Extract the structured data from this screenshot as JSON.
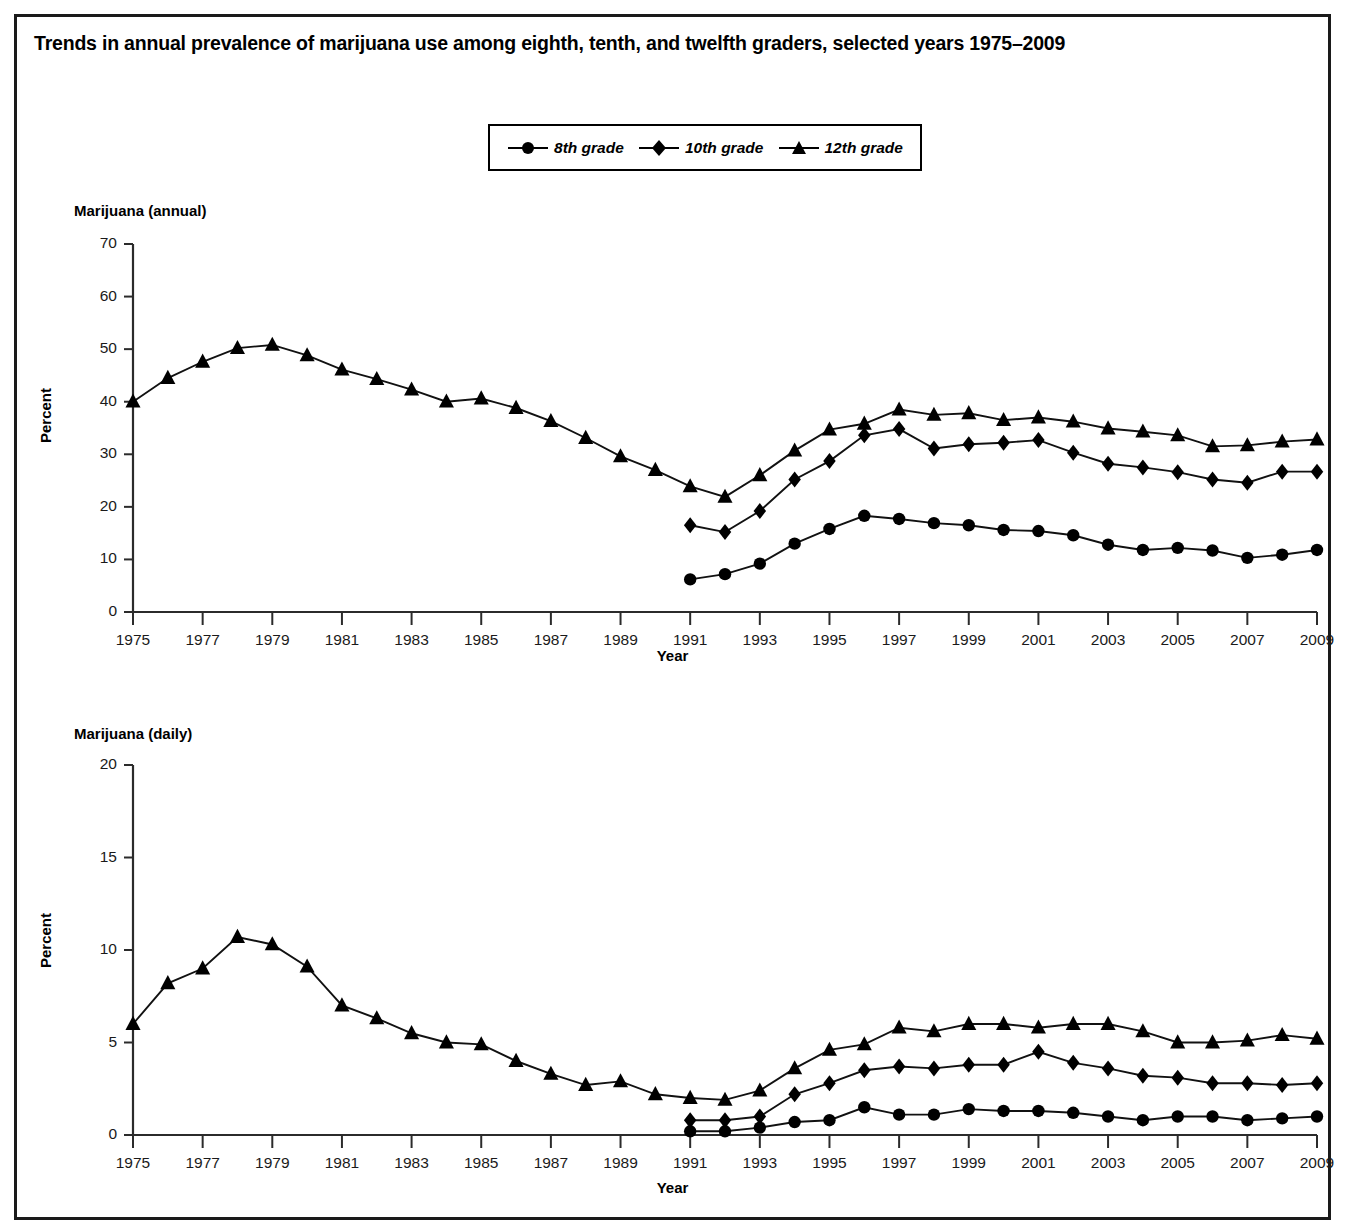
{
  "chart_title": "Trends in annual prevalence of marijuana use among eighth, tenth, and twelfth graders, selected years 1975–2009",
  "legend": {
    "entries": [
      {
        "label": "8th grade",
        "marker": "circle-marker-icon"
      },
      {
        "label": "10th grade",
        "marker": "diamond-marker-icon"
      },
      {
        "label": "12th grade",
        "marker": "triangle-marker-icon"
      }
    ]
  },
  "colors": {
    "ink": "#000000",
    "axis": "#2b2b2b",
    "frame": "#1a1a1a",
    "background": "#ffffff"
  },
  "chart_data": [
    {
      "type": "line",
      "id": "marijuana-annual",
      "title": "Marijuana (annual)",
      "xlabel": "Year",
      "ylabel": "Percent",
      "ylim": [
        0,
        70
      ],
      "yticks": [
        0,
        10,
        20,
        30,
        40,
        50,
        60,
        70
      ],
      "xlim": [
        1975,
        2009
      ],
      "xticks": [
        1975,
        1977,
        1979,
        1981,
        1983,
        1985,
        1987,
        1989,
        1991,
        1993,
        1995,
        1997,
        1999,
        2001,
        2003,
        2005,
        2007,
        2009
      ],
      "grid": false,
      "legend_position": "top-center",
      "x": [
        1975,
        1976,
        1977,
        1978,
        1979,
        1980,
        1981,
        1982,
        1983,
        1984,
        1985,
        1986,
        1987,
        1988,
        1989,
        1990,
        1991,
        1992,
        1993,
        1994,
        1995,
        1996,
        1997,
        1998,
        1999,
        2000,
        2001,
        2002,
        2003,
        2004,
        2005,
        2006,
        2007,
        2008,
        2009
      ],
      "series": [
        {
          "name": "8th grade",
          "marker": "circle",
          "x": [
            1991,
            1992,
            1993,
            1994,
            1995,
            1996,
            1997,
            1998,
            1999,
            2000,
            2001,
            2002,
            2003,
            2004,
            2005,
            2006,
            2007,
            2008,
            2009
          ],
          "values": [
            6.2,
            7.2,
            9.2,
            13.0,
            15.8,
            18.3,
            17.7,
            16.9,
            16.5,
            15.6,
            15.4,
            14.6,
            12.8,
            11.8,
            12.2,
            11.7,
            10.3,
            10.9,
            11.8
          ]
        },
        {
          "name": "10th grade",
          "marker": "diamond",
          "x": [
            1991,
            1992,
            1993,
            1994,
            1995,
            1996,
            1997,
            1998,
            1999,
            2000,
            2001,
            2002,
            2003,
            2004,
            2005,
            2006,
            2007,
            2008,
            2009
          ],
          "values": [
            16.5,
            15.2,
            19.2,
            25.2,
            28.7,
            33.6,
            34.8,
            31.1,
            31.9,
            32.2,
            32.7,
            30.3,
            28.2,
            27.5,
            26.6,
            25.2,
            24.6,
            26.7,
            26.7
          ]
        },
        {
          "name": "12th grade",
          "marker": "triangle",
          "x": [
            1975,
            1976,
            1977,
            1978,
            1979,
            1980,
            1981,
            1982,
            1983,
            1984,
            1985,
            1986,
            1987,
            1988,
            1989,
            1990,
            1991,
            1992,
            1993,
            1994,
            1995,
            1996,
            1997,
            1998,
            1999,
            2000,
            2001,
            2002,
            2003,
            2004,
            2005,
            2006,
            2007,
            2008,
            2009
          ],
          "values": [
            40.0,
            44.5,
            47.6,
            50.2,
            50.8,
            48.8,
            46.1,
            44.3,
            42.3,
            40.0,
            40.6,
            38.8,
            36.3,
            33.1,
            29.6,
            27.0,
            23.9,
            21.9,
            26.0,
            30.7,
            34.7,
            35.8,
            38.5,
            37.5,
            37.8,
            36.5,
            37.0,
            36.2,
            34.9,
            34.3,
            33.6,
            31.5,
            31.7,
            32.4,
            32.8
          ]
        }
      ]
    },
    {
      "type": "line",
      "id": "marijuana-daily",
      "title": "Marijuana (daily)",
      "xlabel": "Year",
      "ylabel": "Percent",
      "ylim": [
        0,
        20
      ],
      "yticks": [
        0,
        5,
        10,
        15,
        20
      ],
      "xlim": [
        1975,
        2009
      ],
      "xticks": [
        1975,
        1977,
        1979,
        1981,
        1983,
        1985,
        1987,
        1989,
        1991,
        1993,
        1995,
        1997,
        1999,
        2001,
        2003,
        2005,
        2007,
        2009
      ],
      "grid": false,
      "legend_position": "top-center",
      "x": [
        1975,
        1976,
        1977,
        1978,
        1979,
        1980,
        1981,
        1982,
        1983,
        1984,
        1985,
        1986,
        1987,
        1988,
        1989,
        1990,
        1991,
        1992,
        1993,
        1994,
        1995,
        1996,
        1997,
        1998,
        1999,
        2000,
        2001,
        2002,
        2003,
        2004,
        2005,
        2006,
        2007,
        2008,
        2009
      ],
      "series": [
        {
          "name": "8th grade",
          "marker": "circle",
          "x": [
            1991,
            1992,
            1993,
            1994,
            1995,
            1996,
            1997,
            1998,
            1999,
            2000,
            2001,
            2002,
            2003,
            2004,
            2005,
            2006,
            2007,
            2008,
            2009
          ],
          "values": [
            0.2,
            0.2,
            0.4,
            0.7,
            0.8,
            1.5,
            1.1,
            1.1,
            1.4,
            1.3,
            1.3,
            1.2,
            1.0,
            0.8,
            1.0,
            1.0,
            0.8,
            0.9,
            1.0
          ]
        },
        {
          "name": "10th grade",
          "marker": "diamond",
          "x": [
            1991,
            1992,
            1993,
            1994,
            1995,
            1996,
            1997,
            1998,
            1999,
            2000,
            2001,
            2002,
            2003,
            2004,
            2005,
            2006,
            2007,
            2008,
            2009
          ],
          "values": [
            0.8,
            0.8,
            1.0,
            2.2,
            2.8,
            3.5,
            3.7,
            3.6,
            3.8,
            3.8,
            4.5,
            3.9,
            3.6,
            3.2,
            3.1,
            2.8,
            2.8,
            2.7,
            2.8
          ]
        },
        {
          "name": "12th grade",
          "marker": "triangle",
          "x": [
            1975,
            1976,
            1977,
            1978,
            1979,
            1980,
            1981,
            1982,
            1983,
            1984,
            1985,
            1986,
            1987,
            1988,
            1989,
            1990,
            1991,
            1992,
            1993,
            1994,
            1995,
            1996,
            1997,
            1998,
            1999,
            2000,
            2001,
            2002,
            2003,
            2004,
            2005,
            2006,
            2007,
            2008,
            2009
          ],
          "values": [
            6.0,
            8.2,
            9.0,
            10.7,
            10.3,
            9.1,
            7.0,
            6.3,
            5.5,
            5.0,
            4.9,
            4.0,
            3.3,
            2.7,
            2.9,
            2.2,
            2.0,
            1.9,
            2.4,
            3.6,
            4.6,
            4.9,
            5.8,
            5.6,
            6.0,
            6.0,
            5.8,
            6.0,
            6.0,
            5.6,
            5.0,
            5.0,
            5.1,
            5.4,
            5.2
          ]
        }
      ]
    }
  ]
}
